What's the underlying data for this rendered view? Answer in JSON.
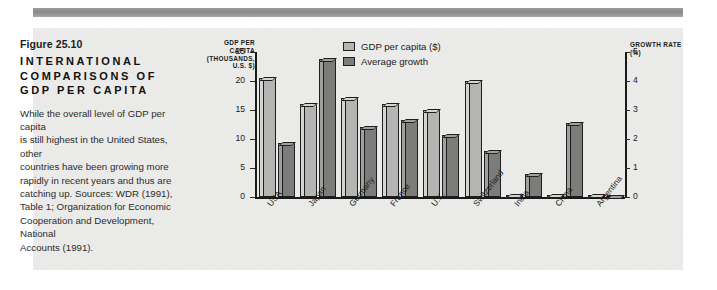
{
  "figure": {
    "number": "Figure 25.10",
    "title": "INTERNATIONAL COMPARISONS OF GDP PER CAPITA",
    "title_lines": [
      "INTERNATIONAL",
      "COMPARISONS OF",
      "GDP PER CAPITA"
    ],
    "body_text": "While the overall level of GDP per capita is still highest in the United States, other countries have been growing more rapidly in recent years and thus are catching up. Sources: WDR (1991), Table 1; Organization for Economic Cooperation and Development, National Accounts (1991).",
    "body_lines": [
      "While the overall level of GDP per capita",
      "is still highest in the United States, other",
      "countries have been growing more",
      "rapidly in recent years and thus are",
      "catching up. Sources: WDR (1991),",
      "Table 1; Organization for Economic",
      "Cooperation and Development, National",
      "Accounts (1991)."
    ]
  },
  "colors": {
    "gdp_bar": "#b4b4b2",
    "growth_bar": "#7c7c7a",
    "panel_bg": "#e9e9e7",
    "rule": "#8a8a8a",
    "axis": "#1a1a1a"
  },
  "chart_data": {
    "type": "bar",
    "title": "INTERNATIONAL COMPARISONS OF GDP PER CAPITA",
    "categories": [
      "USA",
      "Japan",
      "Germany",
      "France",
      "U.K.",
      "Switzerland",
      "India",
      "China",
      "Argentina"
    ],
    "series": [
      {
        "name": "GDP per capita ($)",
        "axis": "left",
        "unit": "thousands of U.S. dollars",
        "values": [
          20.5,
          16.0,
          17.0,
          16.0,
          15.0,
          20.0,
          0.4,
          0.4,
          0.3
        ]
      },
      {
        "name": "Average growth",
        "axis": "right",
        "unit": "percent",
        "values": [
          1.85,
          4.75,
          2.4,
          2.65,
          2.15,
          1.6,
          0.8,
          2.55,
          0.05
        ]
      }
    ],
    "xlabel": "",
    "ylabel": "GDP PER CAPITA (THOUSANDS, U.S. $)",
    "y2label": "GROWTH RATE (%)",
    "ylim": [
      0,
      25
    ],
    "y2lim": [
      0,
      5
    ],
    "yticks": [
      "0",
      "5",
      "10",
      "15",
      "20",
      "25"
    ],
    "y2ticks": [
      "0",
      "1",
      "2",
      "3",
      "4",
      "5"
    ],
    "grid": false,
    "legend_position": "top-center",
    "legend": [
      "GDP per capita ($)",
      "Average growth"
    ]
  }
}
